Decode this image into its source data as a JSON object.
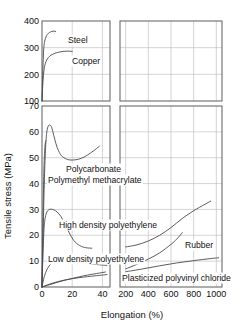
{
  "chart_data": {
    "type": "line",
    "title": "",
    "xlabel": "Elongation (%)",
    "ylabel": "Tensile stress (MPa)",
    "panels": [
      {
        "name": "top-left",
        "xlim": [
          0,
          45
        ],
        "ylim": [
          100,
          400
        ],
        "xticks": [
          0,
          20,
          40
        ],
        "yticks": [
          100,
          200,
          300,
          400
        ],
        "grid": true
      },
      {
        "name": "top-right",
        "xlim": [
          150,
          1050
        ],
        "ylim": [
          100,
          400
        ],
        "xticks": [
          200,
          400,
          600,
          800,
          1000
        ],
        "yticks": [
          100,
          200,
          300,
          400
        ],
        "grid": true
      },
      {
        "name": "bottom-left",
        "xlim": [
          0,
          45
        ],
        "ylim": [
          0,
          70
        ],
        "xticks": [
          0,
          20,
          40
        ],
        "yticks": [
          0,
          10,
          20,
          30,
          40,
          50,
          60,
          70
        ],
        "grid": true
      },
      {
        "name": "bottom-right",
        "xlim": [
          150,
          1050
        ],
        "ylim": [
          0,
          70
        ],
        "xticks": [
          200,
          400,
          600,
          800,
          1000
        ],
        "yticks": [
          0,
          10,
          20,
          30,
          40,
          50,
          60,
          70
        ],
        "grid": true
      }
    ],
    "yticks_top": [
      "400",
      "300",
      "200",
      "100"
    ],
    "yticks_bottom": [
      "70",
      "60",
      "50",
      "40",
      "30",
      "20",
      "10",
      "0"
    ],
    "xticks_left": [
      "0",
      "20",
      "40"
    ],
    "xticks_right": [
      "200",
      "400",
      "600",
      "800",
      "1000"
    ],
    "series": [
      {
        "name": "Steel",
        "label": "Steel",
        "panel": "top-left",
        "points": [
          [
            0,
            100
          ],
          [
            0.4,
            180
          ],
          [
            0.8,
            255
          ],
          [
            1.2,
            300
          ],
          [
            1.8,
            325
          ],
          [
            2.6,
            340
          ],
          [
            3.6,
            350
          ],
          [
            5,
            357
          ],
          [
            6.5,
            361
          ],
          [
            8,
            362
          ],
          [
            9,
            361
          ]
        ]
      },
      {
        "name": "Copper",
        "label": "Copper",
        "panel": "top-left",
        "points": [
          [
            0,
            100
          ],
          [
            0.5,
            160
          ],
          [
            1.1,
            205
          ],
          [
            1.8,
            232
          ],
          [
            2.8,
            250
          ],
          [
            4.2,
            263
          ],
          [
            6,
            272
          ],
          [
            8.5,
            279
          ],
          [
            11,
            283
          ],
          [
            14,
            286
          ],
          [
            17,
            287
          ],
          [
            20,
            286
          ]
        ]
      },
      {
        "name": "Polycarbonate",
        "label": "Polycarbonate",
        "panel": "bottom",
        "points_left": [
          [
            0,
            0
          ],
          [
            0.8,
            22
          ],
          [
            1.6,
            42
          ],
          [
            2.4,
            54
          ],
          [
            3.2,
            60
          ],
          [
            4.2,
            62.3
          ],
          [
            5.2,
            62.6
          ],
          [
            6.2,
            62
          ],
          [
            7.2,
            60
          ],
          [
            8.5,
            57
          ],
          [
            10,
            54
          ],
          [
            12,
            51.5
          ],
          [
            14,
            50.2
          ],
          [
            17,
            49.3
          ],
          [
            20,
            49.1
          ],
          [
            24,
            49.4
          ],
          [
            28,
            50.3
          ],
          [
            32,
            51.8
          ],
          [
            36,
            53.5
          ],
          [
            38,
            54.5
          ]
        ]
      },
      {
        "name": "Polymethyl methacrylate",
        "label": "Polymethyl methacrylate",
        "panel": "bottom-left",
        "points": [
          [
            0,
            0
          ],
          [
            0.4,
            18
          ],
          [
            0.9,
            36
          ],
          [
            1.4,
            48
          ],
          [
            1.9,
            54
          ],
          [
            2.3,
            56
          ],
          [
            2.55,
            56.5
          ]
        ]
      },
      {
        "name": "High density polyethylene",
        "label": "High density polyethylene",
        "panel": "bottom",
        "points_left": [
          [
            0,
            0
          ],
          [
            0.7,
            14
          ],
          [
            1.4,
            23
          ],
          [
            2.2,
            27
          ],
          [
            3.2,
            29
          ],
          [
            4.5,
            29.9
          ],
          [
            6,
            30.1
          ],
          [
            8,
            29.8
          ],
          [
            10,
            29
          ],
          [
            12.5,
            27.3
          ],
          [
            15,
            24.5
          ],
          [
            18,
            21
          ],
          [
            21,
            18
          ],
          [
            25,
            16
          ],
          [
            29,
            15.2
          ],
          [
            33,
            15
          ]
        ],
        "points_right": [
          [
            200,
            15.5
          ],
          [
            300,
            16.3
          ],
          [
            400,
            17.8
          ],
          [
            500,
            20
          ],
          [
            600,
            23
          ],
          [
            700,
            26.5
          ],
          [
            800,
            29.5
          ],
          [
            900,
            32
          ],
          [
            950,
            33.2
          ]
        ]
      },
      {
        "name": "Low density polyethylene",
        "label": "Low density polyethylene",
        "panel": "bottom-left",
        "points": [
          [
            0,
            0
          ],
          [
            1.5,
            4
          ],
          [
            3.5,
            7
          ],
          [
            6,
            9
          ],
          [
            9,
            9.9
          ],
          [
            13,
            10.3
          ],
          [
            17,
            10.4
          ],
          [
            21,
            10.2
          ],
          [
            26,
            9.7
          ],
          [
            31,
            9.1
          ],
          [
            36,
            8.7
          ],
          [
            40,
            8.5
          ],
          [
            43,
            8.4
          ]
        ]
      },
      {
        "name": "Rubber",
        "label": "Rubber",
        "panel": "bottom",
        "points_left": [
          [
            0,
            0
          ],
          [
            5,
            0.9
          ],
          [
            10,
            1.8
          ],
          [
            15,
            2.6
          ],
          [
            20,
            3.3
          ],
          [
            25,
            4.0
          ],
          [
            30,
            4.6
          ],
          [
            36,
            5.2
          ],
          [
            42,
            5.8
          ]
        ],
        "points_right": [
          [
            200,
            7.0
          ],
          [
            300,
            8.8
          ],
          [
            400,
            10.8
          ],
          [
            500,
            13.2
          ],
          [
            600,
            16.5
          ],
          [
            650,
            18.5
          ],
          [
            700,
            21.0
          ]
        ]
      },
      {
        "name": "Plasticized polyvinyl chloride",
        "label": "Plasticized polyvinyl chloride",
        "panel": "bottom",
        "points_left": [
          [
            0,
            0
          ],
          [
            5,
            1.1
          ],
          [
            10,
            2.0
          ],
          [
            16,
            2.8
          ],
          [
            22,
            3.4
          ],
          [
            30,
            4.0
          ],
          [
            38,
            4.5
          ],
          [
            43,
            4.8
          ]
        ],
        "points_right": [
          [
            200,
            5.9
          ],
          [
            350,
            7.0
          ],
          [
            500,
            8.2
          ],
          [
            650,
            9.3
          ],
          [
            800,
            10.2
          ],
          [
            950,
            11.0
          ],
          [
            1020,
            11.3
          ]
        ]
      }
    ]
  },
  "labels": {
    "steel": "Steel",
    "copper": "Copper",
    "polycarbonate": "Polycarbonate",
    "pmma": "Polymethyl methacrylate",
    "hdpe": "High density polyethylene",
    "ldpe": "Low density polyethylene",
    "rubber": "Rubber",
    "pvc": "Plasticized polyvinyl chloride"
  },
  "axes": {
    "x_title": "Elongation (%)",
    "y_title": "Tensile stress (MPa)",
    "y_top": [
      "400",
      "300",
      "200",
      "100"
    ],
    "y_bottom": [
      "70",
      "60",
      "50",
      "40",
      "30",
      "20",
      "10",
      "0"
    ],
    "x_left": [
      "0",
      "20",
      "40"
    ],
    "x_right": [
      "200",
      "400",
      "600",
      "800",
      "1000"
    ]
  },
  "colors": {
    "curve": "#4a4a4a",
    "frame": "#6b6b6b",
    "grid": "#b9b9b9",
    "text": "#111111",
    "background": "#ffffff"
  }
}
